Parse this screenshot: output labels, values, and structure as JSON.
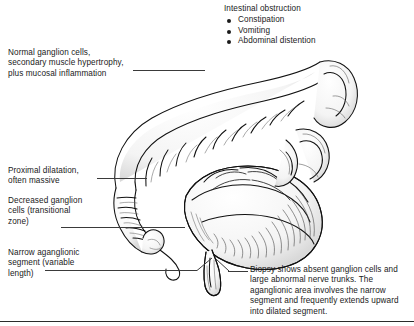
{
  "figure": {
    "style": "black-and-white pen-and-ink medical line drawing"
  },
  "callouts": {
    "intestinal_obstruction": {
      "heading": "Intestinal obstruction",
      "symptoms": [
        "Constipation",
        "Vomiting",
        "Abdominal distention"
      ]
    },
    "normal_ganglion": "Normal ganglion cells,\nsecondary muscle hypertrophy,\nplus mucosal inflammation",
    "proximal_dilatation": "Proximal dilatation,\noften massive",
    "decreased_ganglion": "Decreased ganglion\ncells (transitional\nzone)",
    "narrow_segment": "Narrow aganglionic\nsegment (variable\nlength)",
    "biopsy": "Biopsy shows absent ganglion cells and large abnormal nerve trunks. The aganglionic area involves the narrow segment and frequently extends upward into dilated segment."
  },
  "colors": {
    "ink": "#1a1a1a",
    "leader": "#3a3a3a",
    "rule": "#2b2b2b",
    "background": "#ffffff",
    "shade_light": "#efefef",
    "shade_mid": "#d8d8d8"
  }
}
